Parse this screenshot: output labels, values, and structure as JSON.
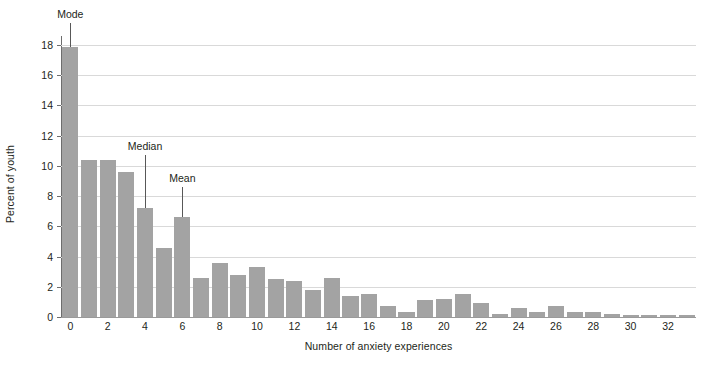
{
  "chart_data": {
    "type": "bar",
    "title": "",
    "xlabel": "Number of anxiety experiences",
    "ylabel": "Percent of youth",
    "xlim": [
      -0.5,
      33.5
    ],
    "ylim": [
      0,
      18.6
    ],
    "grid": true,
    "legend": "none",
    "bar_color": "#a3a3a3",
    "x_ticks": [
      0,
      2,
      4,
      6,
      8,
      10,
      12,
      14,
      16,
      18,
      20,
      22,
      24,
      26,
      28,
      30,
      32
    ],
    "x_tick_labels": [
      "0",
      "2",
      "4",
      "6",
      "8",
      "10",
      "12",
      "14",
      "16",
      "18",
      "20",
      "22",
      "24",
      "26",
      "28",
      "30",
      "32"
    ],
    "y_ticks": [
      0,
      2,
      4,
      6,
      8,
      10,
      12,
      14,
      16,
      18
    ],
    "y_tick_labels": [
      "0",
      "2",
      "4",
      "6",
      "8",
      "10",
      "12",
      "14",
      "16",
      "18"
    ],
    "categories": [
      0,
      1,
      2,
      3,
      4,
      5,
      6,
      7,
      8,
      9,
      10,
      11,
      12,
      13,
      14,
      15,
      16,
      17,
      18,
      19,
      20,
      21,
      22,
      23,
      24,
      25,
      26,
      27,
      28,
      29,
      30,
      31,
      32,
      33
    ],
    "values": [
      17.9,
      10.4,
      10.4,
      9.6,
      7.2,
      4.6,
      6.6,
      2.6,
      3.6,
      2.8,
      3.3,
      2.5,
      2.4,
      1.8,
      2.6,
      1.4,
      1.5,
      0.7,
      0.3,
      1.1,
      1.2,
      1.5,
      0.9,
      0.2,
      0.6,
      0.3,
      0.7,
      0.3,
      0.3,
      0.2,
      0.15,
      0.15,
      0.15,
      0.15
    ],
    "annotations": [
      {
        "label": "Mode",
        "at_x": 0,
        "value": 17.9
      },
      {
        "label": "Median",
        "at_x": 4,
        "value": 7.2
      },
      {
        "label": "Mean",
        "at_x": 6,
        "value": 6.6
      }
    ]
  }
}
